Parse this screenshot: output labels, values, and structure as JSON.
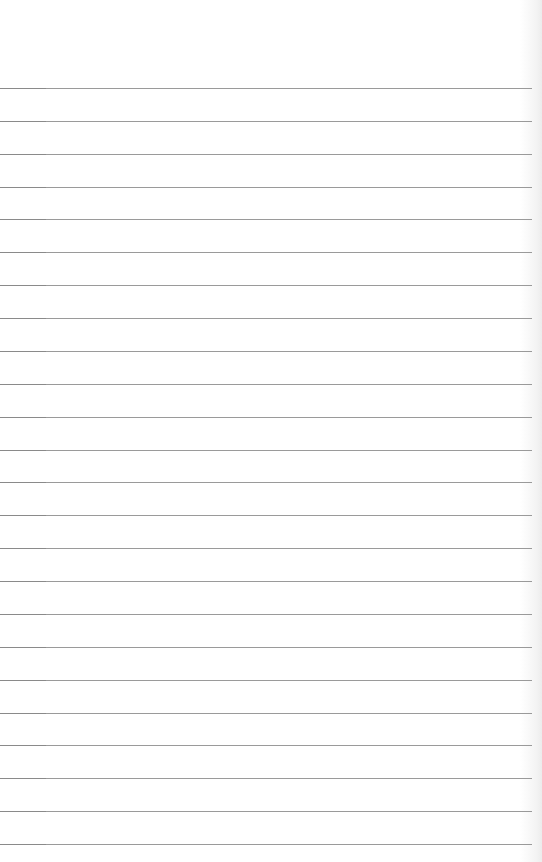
{
  "page": {
    "type": "lined-notepad-paper",
    "line_count": 24,
    "first_line_y": 88,
    "line_spacing": 32.87,
    "line_color": "#9a9a9a",
    "background_color": "#ffffff"
  }
}
